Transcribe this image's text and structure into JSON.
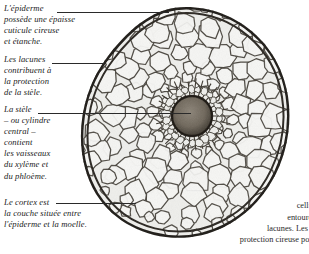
{
  "figure": {
    "kind": "botanical-micrograph",
    "background_color": "#ffffff",
    "ink_color": "#2a2a2a",
    "cell_fill_color": "#f2f2f0",
    "stele_color": "#6a6257"
  },
  "annotations": {
    "epiderme": {
      "heading": "L'épiderme",
      "body_lines": [
        "possède une épaisse",
        "cuticule cireuse",
        "et étanche."
      ]
    },
    "lacunes": {
      "heading": "Les lacunes",
      "body_lines": [
        "contribuent à",
        "la protection",
        "de la stèle."
      ]
    },
    "stele": {
      "heading": "La stèle",
      "body_lines": [
        "– ou cylindre",
        "central –",
        "contient",
        "les vaisseaux",
        "du xylème et",
        "du phloème."
      ]
    },
    "cortex": {
      "heading": "Le cortex est",
      "body_lines": [
        "la couche située entre",
        "l'épiderme et la moelle."
      ]
    }
  },
  "right_text": {
    "clipped": true,
    "lines": [
      "i",
      "tig",
      "trav",
      "cellules",
      "entourée d",
      "lacunes. Les cell",
      "protection cireuse pour e"
    ]
  },
  "chart_data": {
    "type": "scatter",
    "xlabel": "",
    "ylabel": ""
  }
}
